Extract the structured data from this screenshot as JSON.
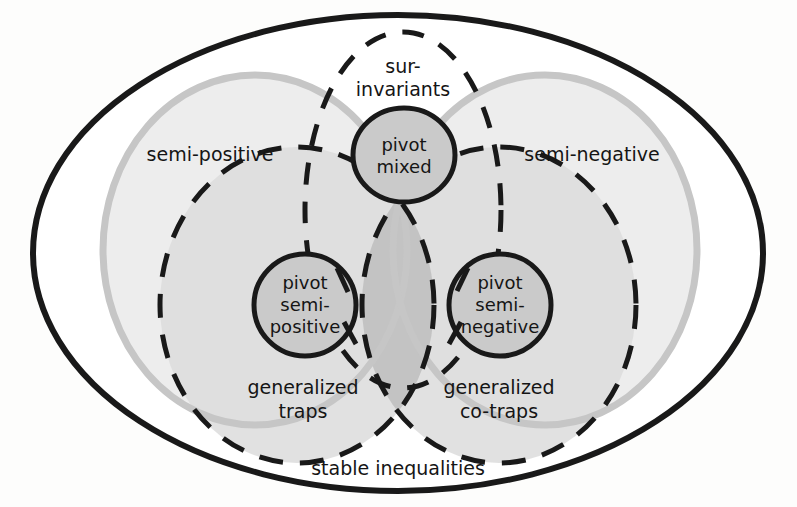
{
  "figure": {
    "kind": "venn-diagram",
    "title_visible": false,
    "background_color": "#fdfdfc"
  },
  "sets": {
    "outer": {
      "label": "stable inequalities",
      "name": "stable-inequalities",
      "stroke_color": "#1a1a1a",
      "stroke_style": "solid",
      "fill_color": "none",
      "shape": "ellipse"
    },
    "semi_positive": {
      "label": "semi-positive",
      "name": "semi-positive",
      "stroke_color": "#c4c4c4",
      "stroke_style": "solid",
      "fill_color": "#eeeeee",
      "shape": "ellipse"
    },
    "semi_negative": {
      "label": "semi-negative",
      "name": "semi-negative",
      "stroke_color": "#c4c4c4",
      "stroke_style": "solid",
      "fill_color": "#eeeeee",
      "shape": "ellipse"
    },
    "sur_invariants": {
      "label_line1": "sur-",
      "label_line2": "invariants",
      "label": "sur-invariants",
      "name": "sur-invariants",
      "stroke_color": "#1a1a1a",
      "stroke_style": "dashed",
      "fill_color": "none",
      "shape": "ellipse"
    },
    "generalized_traps": {
      "label_line1": "generalized",
      "label_line2": "traps",
      "label": "generalized traps",
      "name": "generalized-traps",
      "stroke_color": "#1a1a1a",
      "stroke_style": "dashed",
      "fill_color": "#d8d8d8",
      "shape": "ellipse"
    },
    "generalized_cotraps": {
      "label_line1": "generalized",
      "label_line2": "co-traps",
      "label": "generalized co-traps",
      "name": "generalized-co-traps",
      "stroke_color": "#1a1a1a",
      "stroke_style": "dashed",
      "fill_color": "#d8d8d8",
      "shape": "ellipse"
    },
    "pivot_mixed": {
      "label_line1": "pivot",
      "label_line2": "mixed",
      "label": "pivot mixed",
      "name": "pivot-mixed",
      "stroke_color": "#1a1a1a",
      "stroke_style": "solid",
      "fill_color": "#c9c9c9",
      "shape": "ellipse"
    },
    "pivot_semi_positive": {
      "label_line1": "pivot",
      "label_line2": "semi-",
      "label_line3": "positive",
      "label": "pivot semi-positive",
      "name": "pivot-semi-positive",
      "stroke_color": "#1a1a1a",
      "stroke_style": "solid",
      "fill_color": "#c9c9c9",
      "shape": "ellipse"
    },
    "pivot_semi_negative": {
      "label_line1": "pivot",
      "label_line2": "semi-",
      "label_line3": "negative",
      "label": "pivot semi-negative",
      "name": "pivot-semi-negative",
      "stroke_color": "#1a1a1a",
      "stroke_style": "solid",
      "fill_color": "#c9c9c9",
      "shape": "ellipse"
    }
  },
  "palette": {
    "ink": "#1a1a1a",
    "light_gray_stroke": "#c4c4c4",
    "light_gray_fill": "#eeeeee",
    "mid_gray_fill": "#d8d8d8",
    "overlap_fill": "#c2c2c2",
    "pivot_fill": "#c9c9c9",
    "background": "#fdfdfc"
  }
}
